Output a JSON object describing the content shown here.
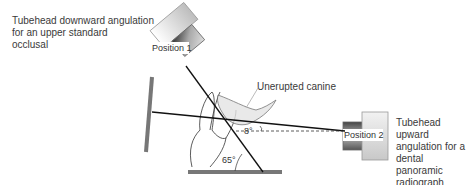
{
  "labels": {
    "top_left": [
      "Tubehead downward angulation",
      "for an upper standard",
      "occlusal"
    ],
    "right": [
      "Tubehead upward",
      "angulation for a",
      "dental panoramic",
      "radiograph"
    ],
    "unerupted": "Unerupted canine",
    "position1": "Position 1",
    "position2": "Position 2",
    "angle_upward": "8°",
    "angle_downward": "65°"
  },
  "colors": {
    "line": "#111111",
    "film": "#777777",
    "text": "#3a3a3a"
  }
}
